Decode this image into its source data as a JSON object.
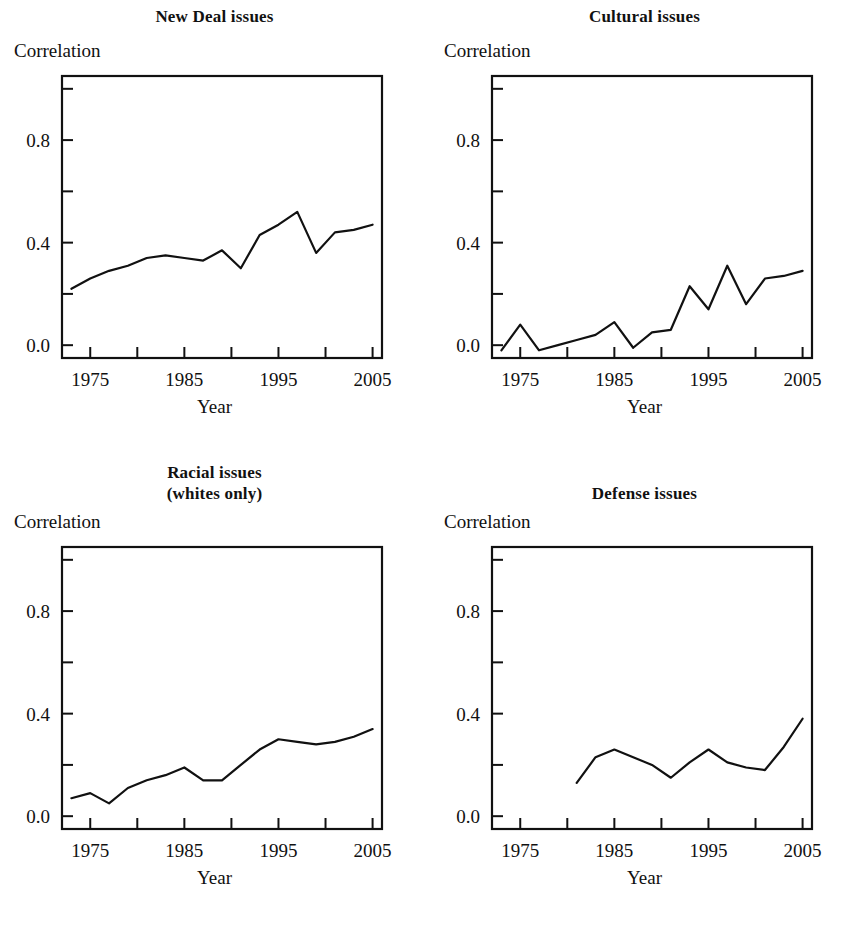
{
  "figure": {
    "background": "#ffffff",
    "ink_color": "#111111",
    "panel_count": 4
  },
  "chart_data": [
    {
      "type": "line",
      "panel": "top-left",
      "title": "New Deal issues",
      "title_lines": [
        "New Deal issues"
      ],
      "ylabel": "Correlation",
      "xlabel": "Year",
      "xlim": [
        1972,
        2006
      ],
      "ylim": [
        -0.05,
        1.05
      ],
      "xticks": [
        1975,
        1980,
        1985,
        1990,
        1995,
        2000,
        2005
      ],
      "xticklabels": [
        "1975",
        "",
        "1985",
        "",
        "1995",
        "",
        "2005"
      ],
      "yticks": [
        0.0,
        0.2,
        0.4,
        0.6,
        0.8,
        1.0
      ],
      "yticklabels": [
        "0.0",
        "",
        "0.4",
        "",
        "0.8",
        ""
      ],
      "grid": false,
      "legend": "none",
      "x": [
        1973,
        1975,
        1977,
        1979,
        1981,
        1983,
        1985,
        1987,
        1989,
        1991,
        1993,
        1995,
        1997,
        1999,
        2001,
        2003,
        2005
      ],
      "values": [
        0.22,
        0.26,
        0.29,
        0.31,
        0.34,
        0.35,
        0.34,
        0.33,
        0.37,
        0.3,
        0.43,
        0.47,
        0.52,
        0.36,
        0.44,
        0.45,
        0.47
      ]
    },
    {
      "type": "line",
      "panel": "top-right",
      "title": "Cultural issues",
      "title_lines": [
        "Cultural issues"
      ],
      "ylabel": "Correlation",
      "xlabel": "Year",
      "xlim": [
        1972,
        2006
      ],
      "ylim": [
        -0.05,
        1.05
      ],
      "xticks": [
        1975,
        1980,
        1985,
        1990,
        1995,
        2000,
        2005
      ],
      "xticklabels": [
        "1975",
        "",
        "1985",
        "",
        "1995",
        "",
        "2005"
      ],
      "yticks": [
        0.0,
        0.2,
        0.4,
        0.6,
        0.8,
        1.0
      ],
      "yticklabels": [
        "0.0",
        "",
        "0.4",
        "",
        "0.8",
        ""
      ],
      "grid": false,
      "legend": "none",
      "x": [
        1973,
        1975,
        1977,
        1979,
        1981,
        1983,
        1985,
        1987,
        1989,
        1991,
        1993,
        1995,
        1997,
        1999,
        2001,
        2003,
        2005
      ],
      "values": [
        -0.02,
        0.08,
        -0.02,
        0.0,
        0.02,
        0.04,
        0.09,
        -0.01,
        0.05,
        0.06,
        0.23,
        0.14,
        0.31,
        0.16,
        0.26,
        0.27,
        0.29
      ]
    },
    {
      "type": "line",
      "panel": "bottom-left",
      "title": "Racial issues (whites only)",
      "title_lines": [
        "Racial issues",
        "(whites only)"
      ],
      "ylabel": "Correlation",
      "xlabel": "Year",
      "xlim": [
        1972,
        2006
      ],
      "ylim": [
        -0.05,
        1.05
      ],
      "xticks": [
        1975,
        1980,
        1985,
        1990,
        1995,
        2000,
        2005
      ],
      "xticklabels": [
        "1975",
        "",
        "1985",
        "",
        "1995",
        "",
        "2005"
      ],
      "yticks": [
        0.0,
        0.2,
        0.4,
        0.6,
        0.8,
        1.0
      ],
      "yticklabels": [
        "0.0",
        "",
        "0.4",
        "",
        "0.8",
        ""
      ],
      "grid": false,
      "legend": "none",
      "x": [
        1973,
        1975,
        1977,
        1979,
        1981,
        1983,
        1985,
        1987,
        1989,
        1991,
        1993,
        1995,
        1997,
        1999,
        2001,
        2003,
        2005
      ],
      "values": [
        0.07,
        0.09,
        0.05,
        0.11,
        0.14,
        0.16,
        0.19,
        0.14,
        0.14,
        0.2,
        0.26,
        0.3,
        0.29,
        0.28,
        0.29,
        0.31,
        0.34
      ]
    },
    {
      "type": "line",
      "panel": "bottom-right",
      "title": "Defense issues",
      "title_lines": [
        "Defense issues"
      ],
      "ylabel": "Correlation",
      "xlabel": "Year",
      "xlim": [
        1972,
        2006
      ],
      "ylim": [
        -0.05,
        1.05
      ],
      "xticks": [
        1975,
        1980,
        1985,
        1990,
        1995,
        2000,
        2005
      ],
      "xticklabels": [
        "1975",
        "",
        "1985",
        "",
        "1995",
        "",
        "2005"
      ],
      "yticks": [
        0.0,
        0.2,
        0.4,
        0.6,
        0.8,
        1.0
      ],
      "yticklabels": [
        "0.0",
        "",
        "0.4",
        "",
        "0.8",
        ""
      ],
      "grid": false,
      "legend": "none",
      "x": [
        1981,
        1983,
        1985,
        1987,
        1989,
        1991,
        1993,
        1995,
        1997,
        1999,
        2001,
        2003,
        2005
      ],
      "values": [
        0.13,
        0.23,
        0.26,
        0.23,
        0.2,
        0.15,
        0.21,
        0.26,
        0.21,
        0.19,
        0.18,
        0.27,
        0.38
      ]
    }
  ]
}
